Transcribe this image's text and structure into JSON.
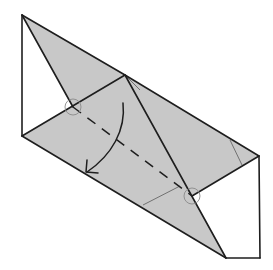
{
  "diagram": {
    "title": "",
    "type": "origami-fold-step",
    "colors": {
      "paper_shaded": "#c8c8c8",
      "line": "#1e1e1e",
      "background": "#ffffff"
    },
    "symbols": [
      "valley-fold-line",
      "fold-arrow",
      "reference-point-circle",
      "reference-point-circle"
    ]
  }
}
